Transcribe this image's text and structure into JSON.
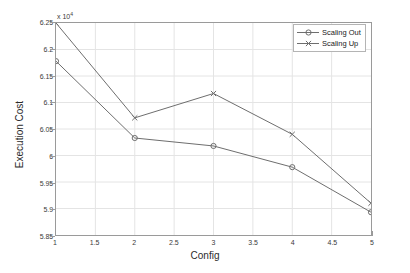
{
  "chart_data": {
    "type": "line",
    "title": "",
    "xlabel": "Config",
    "ylabel": "Execution Cost",
    "y_exponent_label": "x 10",
    "y_exponent_power": "4",
    "y_scale_factor": 10000,
    "xlim": [
      1,
      5
    ],
    "ylim": [
      5.85,
      6.25
    ],
    "grid": true,
    "legend_position": "top-right",
    "x": [
      1,
      2,
      3,
      4,
      5
    ],
    "xticks": [
      "1",
      "1.5",
      "2",
      "2.5",
      "3",
      "3.5",
      "4",
      "4.5",
      "5"
    ],
    "xtick_values": [
      1,
      1.5,
      2,
      2.5,
      3,
      3.5,
      4,
      4.5,
      5
    ],
    "yticks": [
      "5.85",
      "5.9",
      "5.95",
      "6",
      "6.05",
      "6.1",
      "6.15",
      "6.2",
      "6.25"
    ],
    "ytick_values": [
      5.85,
      5.9,
      5.95,
      6.0,
      6.05,
      6.1,
      6.15,
      6.2,
      6.25
    ],
    "series": [
      {
        "name": "Scaling Out",
        "marker": "circle-marker",
        "color": "#6e6e6e",
        "values": [
          6.178,
          6.033,
          6.018,
          5.978,
          5.893
        ]
      },
      {
        "name": "Scaling Up",
        "marker": "x-marker",
        "color": "#6e6e6e",
        "values": [
          6.25,
          6.071,
          6.117,
          6.04,
          5.91
        ]
      }
    ]
  },
  "figure": {
    "background_color": "#ffffff",
    "axis_color": "#9a9a9a",
    "grid_color": "#e4e4e4",
    "text_color": "#2b2b2b"
  }
}
